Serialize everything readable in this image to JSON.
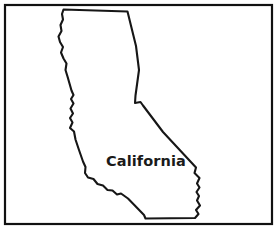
{
  "figure": {
    "kind": "state-outline-map",
    "width": 277,
    "height": 231,
    "background_color": "#ffffff"
  },
  "frame": {
    "name": "border-frame",
    "x": 5,
    "y": 5,
    "width": 267,
    "height": 219,
    "stroke_color": "#111111",
    "stroke_width": 2.2
  },
  "state": {
    "name": "California",
    "label": "California",
    "label_x": 106,
    "label_y": 166,
    "label_color": "#1a1a1a",
    "label_font_size": 14.5,
    "outline_color": "#161616",
    "fill_color": "#ffffff",
    "outline_width": 2.1,
    "bounds": {
      "left": 58,
      "top": 9,
      "right": 201,
      "bottom": 219
    },
    "outline_path": "M 63.5 9.5 L 127.5 11.5 L 136.0 46.0 L 139.0 70.0 L 135.5 95.5 L 135.0 103.0 L 140.5 102.0 L 143.0 105.5 L 163.0 132.0 L 183.0 153.5 L 196.0 167.5 L 194.5 173.0 L 199.5 178.0 L 197.0 183.5 L 199.5 187.5 L 196.5 192.0 L 199.0 196.0 L 197.0 200.5 L 200.0 205.5 L 196.0 210.0 L 198.5 214.0 L 195.0 218.0 L 145.5 218.5 L 144.0 215.0 L 128.0 198.5 L 121.0 193.5 L 117.0 194.5 L 112.5 190.5 L 107.5 190.0 L 103.0 185.5 L 97.5 184.0 L 93.5 179.0 L 88.0 177.5 L 85.0 173.0 L 85.5 167.0 L 83.0 161.5 L 79.0 150.0 L 75.5 139.5 L 74.0 131.5 L 70.0 128.0 L 72.5 122.5 L 70.0 118.0 L 73.0 113.5 L 70.5 108.5 L 73.5 103.5 L 71.0 99.0 L 73.5 95.0 L 71.5 90.5 L 69.5 83.5 L 67.5 76.5 L 65.5 70.0 L 66.5 63.5 L 63.5 58.5 L 61.0 52.5 L 63.0 47.0 L 60.0 42.0 L 58.5 36.5 L 61.5 31.0 L 60.5 25.0 L 63.0 19.5 L 62.0 14.0 Z"
  }
}
